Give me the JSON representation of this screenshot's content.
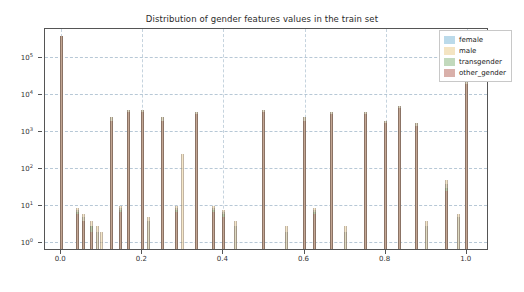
{
  "chart_data": {
    "type": "bar",
    "title": "Distribution of gender features values in the train set",
    "xlabel": "",
    "ylabel": "",
    "scale": "log",
    "grid": true,
    "xlim": [
      -0.04,
      1.05
    ],
    "ylim": [
      0.7,
      600000
    ],
    "yticks": [
      1,
      10,
      100,
      1000,
      10000,
      100000
    ],
    "ytick_labels": [
      "10^0",
      "10^1",
      "10^2",
      "10^3",
      "10^4",
      "10^5"
    ],
    "xticks": [
      0.0,
      0.2,
      0.4,
      0.6,
      0.8,
      1.0
    ],
    "xtick_labels": [
      "0.0",
      "0.2",
      "0.4",
      "0.6",
      "0.8",
      "1.0"
    ],
    "legend": {
      "position": "upper right",
      "entries": [
        {
          "name": "female",
          "color": "#9ecae1"
        },
        {
          "name": "male",
          "color": "#f0d9a8"
        },
        {
          "name": "transgender",
          "color": "#a8c9a0"
        },
        {
          "name": "other_gender",
          "color": "#c98f86"
        }
      ]
    },
    "series": [
      {
        "name": "female",
        "color": "#9ecae1",
        "points": [
          {
            "x": 0.0,
            "y": 400000
          },
          {
            "x": 0.04,
            "y": 8
          },
          {
            "x": 0.055,
            "y": 5
          },
          {
            "x": 0.075,
            "y": 3
          },
          {
            "x": 0.09,
            "y": 2
          },
          {
            "x": 0.125,
            "y": 2500
          },
          {
            "x": 0.145,
            "y": 9
          },
          {
            "x": 0.167,
            "y": 4000
          },
          {
            "x": 0.2,
            "y": 4000
          },
          {
            "x": 0.215,
            "y": 4
          },
          {
            "x": 0.25,
            "y": 2500
          },
          {
            "x": 0.285,
            "y": 9
          },
          {
            "x": 0.333,
            "y": 3500
          },
          {
            "x": 0.375,
            "y": 9
          },
          {
            "x": 0.4,
            "y": 7
          },
          {
            "x": 0.43,
            "y": 3
          },
          {
            "x": 0.5,
            "y": 4000
          },
          {
            "x": 0.555,
            "y": 2
          },
          {
            "x": 0.6,
            "y": 2500
          },
          {
            "x": 0.625,
            "y": 8
          },
          {
            "x": 0.667,
            "y": 3500
          },
          {
            "x": 0.7,
            "y": 2
          },
          {
            "x": 0.75,
            "y": 3500
          },
          {
            "x": 0.8,
            "y": 2000
          },
          {
            "x": 0.833,
            "y": 5000
          },
          {
            "x": 0.875,
            "y": 1800
          },
          {
            "x": 0.9,
            "y": 3
          },
          {
            "x": 0.95,
            "y": 40
          },
          {
            "x": 0.98,
            "y": 5
          },
          {
            "x": 1.0,
            "y": 25000
          }
        ]
      },
      {
        "name": "male",
        "color": "#f0d9a8",
        "points": [
          {
            "x": 0.0,
            "y": 400000
          },
          {
            "x": 0.04,
            "y": 9
          },
          {
            "x": 0.055,
            "y": 6
          },
          {
            "x": 0.075,
            "y": 4
          },
          {
            "x": 0.09,
            "y": 3
          },
          {
            "x": 0.1,
            "y": 2
          },
          {
            "x": 0.125,
            "y": 2500
          },
          {
            "x": 0.145,
            "y": 10
          },
          {
            "x": 0.167,
            "y": 4000
          },
          {
            "x": 0.2,
            "y": 4000
          },
          {
            "x": 0.215,
            "y": 5
          },
          {
            "x": 0.25,
            "y": 2500
          },
          {
            "x": 0.285,
            "y": 10
          },
          {
            "x": 0.3,
            "y": 250
          },
          {
            "x": 0.333,
            "y": 3500
          },
          {
            "x": 0.375,
            "y": 10
          },
          {
            "x": 0.4,
            "y": 8
          },
          {
            "x": 0.43,
            "y": 4
          },
          {
            "x": 0.5,
            "y": 4000
          },
          {
            "x": 0.555,
            "y": 3
          },
          {
            "x": 0.6,
            "y": 2500
          },
          {
            "x": 0.625,
            "y": 9
          },
          {
            "x": 0.667,
            "y": 3500
          },
          {
            "x": 0.7,
            "y": 3
          },
          {
            "x": 0.75,
            "y": 3500
          },
          {
            "x": 0.8,
            "y": 2000
          },
          {
            "x": 0.833,
            "y": 5000
          },
          {
            "x": 0.875,
            "y": 1800
          },
          {
            "x": 0.9,
            "y": 4
          },
          {
            "x": 0.95,
            "y": 50
          },
          {
            "x": 0.98,
            "y": 6
          },
          {
            "x": 1.0,
            "y": 25000
          }
        ]
      },
      {
        "name": "transgender",
        "color": "#a8c9a0",
        "points": [
          {
            "x": 0.0,
            "y": 400000
          },
          {
            "x": 0.04,
            "y": 7
          },
          {
            "x": 0.055,
            "y": 4
          },
          {
            "x": 0.075,
            "y": 3
          },
          {
            "x": 0.125,
            "y": 2000
          },
          {
            "x": 0.145,
            "y": 8
          },
          {
            "x": 0.167,
            "y": 3500
          },
          {
            "x": 0.2,
            "y": 3500
          },
          {
            "x": 0.25,
            "y": 2000
          },
          {
            "x": 0.285,
            "y": 8
          },
          {
            "x": 0.333,
            "y": 3000
          },
          {
            "x": 0.375,
            "y": 8
          },
          {
            "x": 0.4,
            "y": 6
          },
          {
            "x": 0.5,
            "y": 3500
          },
          {
            "x": 0.6,
            "y": 2000
          },
          {
            "x": 0.625,
            "y": 7
          },
          {
            "x": 0.667,
            "y": 3000
          },
          {
            "x": 0.75,
            "y": 3000
          },
          {
            "x": 0.8,
            "y": 1800
          },
          {
            "x": 0.833,
            "y": 4500
          },
          {
            "x": 0.875,
            "y": 1500
          },
          {
            "x": 0.95,
            "y": 30
          },
          {
            "x": 1.0,
            "y": 20000
          }
        ]
      },
      {
        "name": "other_gender",
        "color": "#c98f86",
        "points": [
          {
            "x": 0.0,
            "y": 400000
          },
          {
            "x": 0.04,
            "y": 6
          },
          {
            "x": 0.055,
            "y": 4
          },
          {
            "x": 0.075,
            "y": 2
          },
          {
            "x": 0.125,
            "y": 2000
          },
          {
            "x": 0.145,
            "y": 7
          },
          {
            "x": 0.167,
            "y": 3500
          },
          {
            "x": 0.2,
            "y": 3500
          },
          {
            "x": 0.25,
            "y": 2000
          },
          {
            "x": 0.285,
            "y": 7
          },
          {
            "x": 0.333,
            "y": 3000
          },
          {
            "x": 0.375,
            "y": 7
          },
          {
            "x": 0.4,
            "y": 5
          },
          {
            "x": 0.5,
            "y": 3500
          },
          {
            "x": 0.6,
            "y": 2000
          },
          {
            "x": 0.625,
            "y": 6
          },
          {
            "x": 0.667,
            "y": 3000
          },
          {
            "x": 0.75,
            "y": 3000
          },
          {
            "x": 0.8,
            "y": 1800
          },
          {
            "x": 0.833,
            "y": 4500
          },
          {
            "x": 0.875,
            "y": 1500
          },
          {
            "x": 0.95,
            "y": 25
          },
          {
            "x": 1.0,
            "y": 20000
          }
        ]
      }
    ]
  }
}
